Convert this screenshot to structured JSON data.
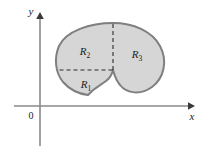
{
  "figure": {
    "type": "math-region-diagram",
    "background_color": "#ffffff"
  },
  "axes": {
    "x_label": "x",
    "y_label": "y",
    "origin_label": "0",
    "axis_color": "#8a8a8a",
    "x_axis": {
      "y": 106,
      "x_start": 14,
      "x_end": 192
    },
    "y_axis": {
      "x": 40,
      "y_start": 14,
      "y_end": 146
    }
  },
  "shape": {
    "name": "kidney-region",
    "fill_color": "#d6d6d6",
    "stroke_color": "#7f7f7f",
    "bounds": {
      "x_min": 58,
      "x_max": 164,
      "y_min": 23,
      "y_max": 95
    }
  },
  "dashed_lines": {
    "stroke_color": "#2b2b2b",
    "vertical": {
      "x": 113,
      "y_top": 23,
      "y_bottom": 70
    },
    "horizontal": {
      "y": 70,
      "x_left": 59,
      "x_right": 113
    }
  },
  "regions": [
    {
      "id": "R1",
      "base": "R",
      "sub": "1",
      "x": 86,
      "y": 85
    },
    {
      "id": "R2",
      "base": "R",
      "sub": "2",
      "x": 85,
      "y": 52
    },
    {
      "id": "R3",
      "base": "R",
      "sub": "3",
      "x": 137,
      "y": 55
    }
  ]
}
